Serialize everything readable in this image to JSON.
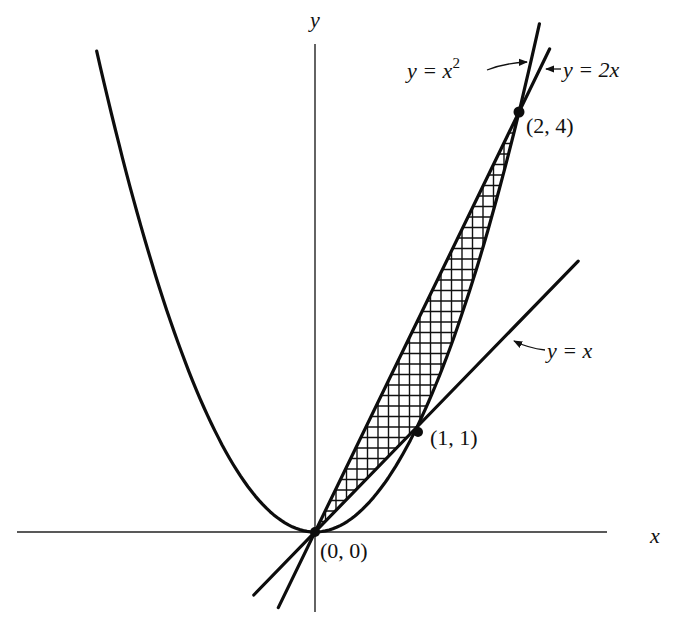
{
  "figure": {
    "axes": {
      "x_label": "x",
      "y_label": "y",
      "origin_px": [
        315,
        532
      ],
      "scale_px_per_unit": [
        102,
        105
      ],
      "x_axis_px": [
        17,
        607
      ],
      "y_axis_px": [
        44,
        612
      ]
    },
    "curves": [
      {
        "id": "parabola",
        "equation": "y = x^2",
        "label": "y = x",
        "label_sup": "2",
        "x_range": [
          -2.14,
          2.2
        ]
      },
      {
        "id": "line2x",
        "equation": "y = 2x",
        "label": "y = 2x",
        "x_range": [
          -0.36,
          2.3
        ]
      },
      {
        "id": "linex",
        "equation": "y = x",
        "label": "y = x",
        "x_range": [
          -0.6,
          2.58
        ]
      }
    ],
    "points": [
      {
        "coord": [
          0,
          0
        ],
        "label": "(0, 0)"
      },
      {
        "coord": [
          1,
          1
        ],
        "label": "(1, 1)"
      },
      {
        "coord": [
          2,
          4
        ],
        "label": "(2, 4)"
      }
    ],
    "shaded_region": {
      "upper": "y = 2x",
      "lower": "y = x for 0≤x≤1, y = x^2 for 1≤x≤2",
      "x_range": [
        0,
        2
      ],
      "pattern": "square crosshatch",
      "spacing_px": 10.5
    }
  }
}
